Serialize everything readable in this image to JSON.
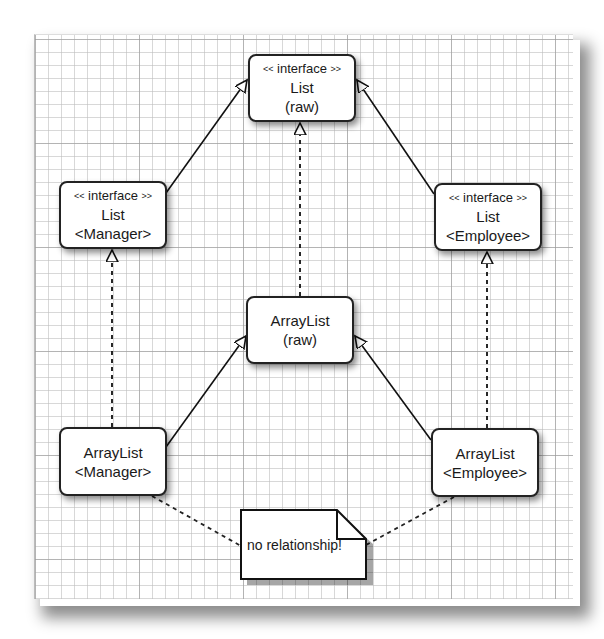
{
  "diagram": {
    "type": "uml-class-relationships",
    "nodes": [
      {
        "id": "list-raw",
        "stereotype": "interface",
        "stereo_open": "<<",
        "stereo_close": ">>",
        "line1": "List",
        "line2": "(raw)"
      },
      {
        "id": "list-manager",
        "stereotype": "interface",
        "stereo_open": "<<",
        "stereo_close": ">>",
        "line1": "List",
        "line2": "<Manager>"
      },
      {
        "id": "list-employee",
        "stereotype": "interface",
        "stereo_open": "<<",
        "stereo_close": ">>",
        "line1": "List",
        "line2": "<Employee>"
      },
      {
        "id": "arraylist-raw",
        "line1": "ArrayList",
        "line2": "(raw)"
      },
      {
        "id": "arraylist-manager",
        "line1": "ArrayList",
        "line2": "<Manager>"
      },
      {
        "id": "arraylist-employee",
        "line1": "ArrayList",
        "line2": "<Employee>"
      }
    ],
    "note": {
      "text": "no relationship!"
    },
    "edges": [
      {
        "from": "list-manager",
        "to": "list-raw",
        "style": "solid",
        "head": "hollow-triangle",
        "kind": "generalization"
      },
      {
        "from": "list-employee",
        "to": "list-raw",
        "style": "solid",
        "head": "hollow-triangle",
        "kind": "generalization"
      },
      {
        "from": "arraylist-raw",
        "to": "list-raw",
        "style": "dashed",
        "head": "hollow-triangle",
        "kind": "realization"
      },
      {
        "from": "arraylist-manager",
        "to": "list-manager",
        "style": "dashed",
        "head": "hollow-triangle",
        "kind": "realization"
      },
      {
        "from": "arraylist-employee",
        "to": "list-employee",
        "style": "dashed",
        "head": "hollow-triangle",
        "kind": "realization"
      },
      {
        "from": "arraylist-manager",
        "to": "arraylist-raw",
        "style": "solid",
        "head": "hollow-triangle",
        "kind": "generalization"
      },
      {
        "from": "arraylist-employee",
        "to": "arraylist-raw",
        "style": "solid",
        "head": "hollow-triangle",
        "kind": "generalization"
      },
      {
        "from": "note",
        "to": "arraylist-manager",
        "style": "dashed",
        "head": "none",
        "kind": "note-anchor"
      },
      {
        "from": "note",
        "to": "arraylist-employee",
        "style": "dashed",
        "head": "none",
        "kind": "note-anchor"
      }
    ]
  }
}
